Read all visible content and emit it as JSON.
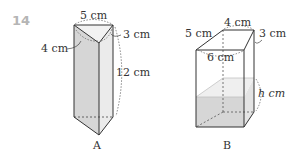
{
  "question_number": "14",
  "figure_a": {
    "label": "A",
    "dims": {
      "top": "5 cm",
      "left": "4 cm",
      "right": "3 cm",
      "height": "12 cm"
    }
  },
  "figure_b": {
    "label": "B",
    "dims": {
      "top": "4 cm",
      "left": "5 cm",
      "right": "3 cm",
      "front": "6 cm",
      "water": "h cm"
    }
  }
}
